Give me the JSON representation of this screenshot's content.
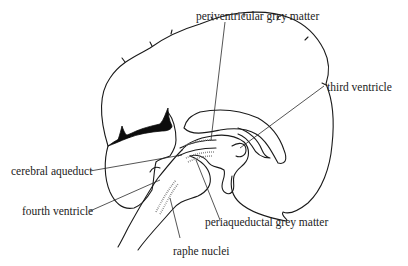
{
  "diagram": {
    "labels": [
      {
        "id": "periventricular",
        "text": "periventricular grey matter"
      },
      {
        "id": "third_ventricle",
        "text": "third ventricle"
      },
      {
        "id": "cerebral_aqueduct",
        "text": "cerebral aqueduct"
      },
      {
        "id": "fourth_ventricle",
        "text": "fourth ventricle"
      },
      {
        "id": "periaqueductal",
        "text": "periaqueductal grey matter"
      },
      {
        "id": "raphe_nuclei",
        "text": "raphe nuclei"
      }
    ],
    "colors": {
      "line": "#1a1a1a",
      "stipple": "#777777",
      "background": "#ffffff"
    }
  }
}
